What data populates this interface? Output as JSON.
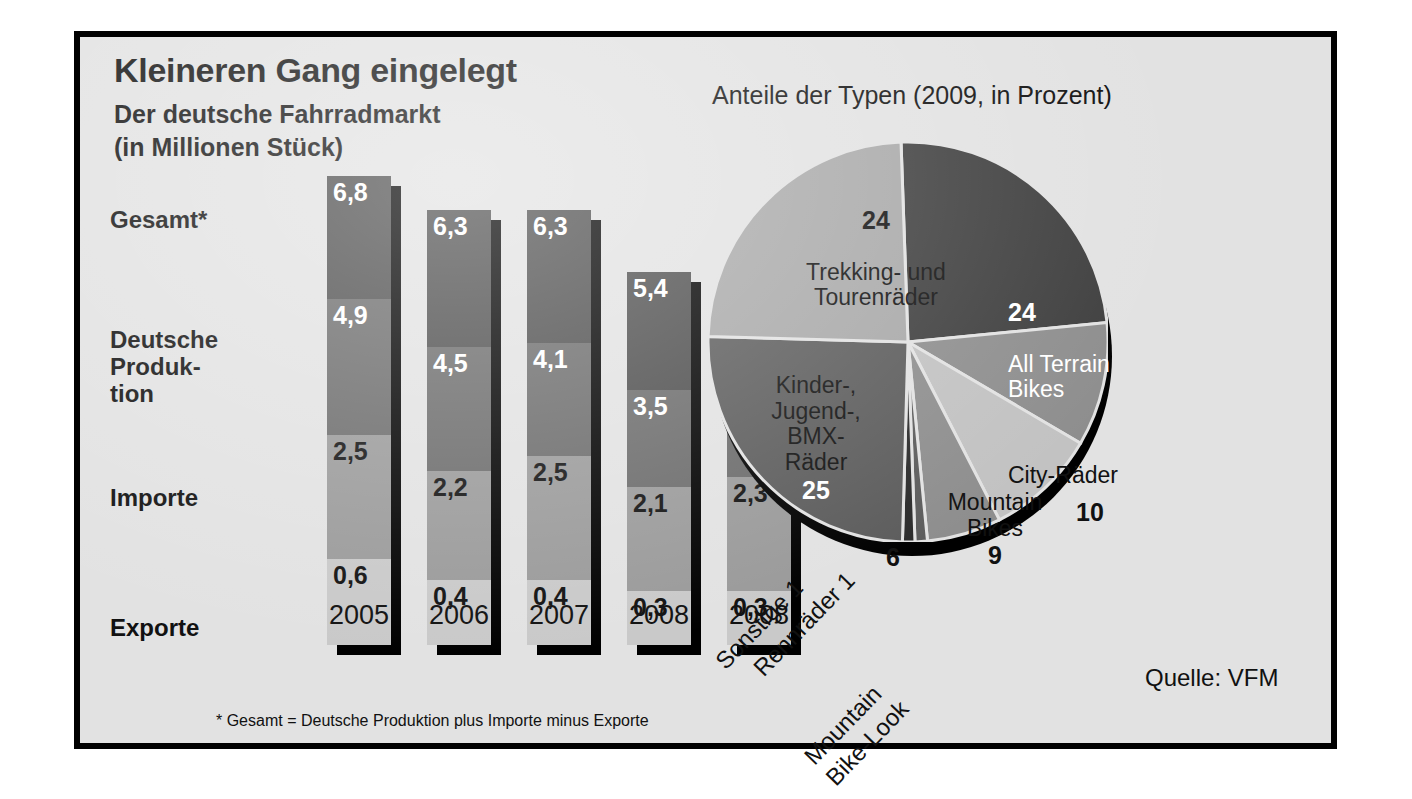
{
  "title": "Kleineren Gang eingelegt",
  "subtitle_line1": "Der deutsche Fahrradmarkt",
  "subtitle_line2": "(in Millionen Stück)",
  "pie_header": "Anteile der Typen (2009, in Prozent)",
  "source": "Quelle: VFM",
  "footnote": "* Gesamt = Deutsche Produktion plus Importe minus Exporte",
  "row_labels": {
    "total": "Gesamt*",
    "production": "Deutsche\nProduk-\ntion",
    "imports": "Importe",
    "exports": "Exporte"
  },
  "colors": {
    "background": "#e2e2e2",
    "frame": "#000000",
    "seg_total": "#4d4d4d",
    "seg_production": "#6b6b6b",
    "seg_imports": "#9a9a9a",
    "seg_exports": "#c9c9c9",
    "shadow": "#000000",
    "center_fill": "#ffffff"
  },
  "pie_center_text": "Gesamt:\n5,2 Millionen\nStück",
  "chart_data": [
    {
      "type": "bar",
      "title": "Der deutsche Fahrradmarkt (in Millionen Stück)",
      "xlabel": "",
      "ylabel": "Millionen Stück",
      "categories": [
        "2005",
        "2006",
        "2007",
        "2008",
        "2008"
      ],
      "series": [
        {
          "name": "Gesamt*",
          "values": [
            6.8,
            6.3,
            6.3,
            5.4,
            5.2
          ],
          "labels": [
            "6,8",
            "6,3",
            "6,3",
            "5,4",
            "5,2"
          ]
        },
        {
          "name": "Deutsche Produktion",
          "values": [
            4.9,
            4.5,
            4.1,
            3.5,
            3.2
          ],
          "labels": [
            "4,9",
            "4,5",
            "4,1",
            "3,5",
            "3,2"
          ]
        },
        {
          "name": "Importe",
          "values": [
            2.5,
            2.2,
            2.5,
            2.1,
            2.3
          ],
          "labels": [
            "2,5",
            "2,2",
            "2,5",
            "2,1",
            "2,3"
          ]
        },
        {
          "name": "Exporte",
          "values": [
            0.6,
            0.4,
            0.4,
            0.3,
            0.3
          ],
          "labels": [
            "0,6",
            "0,4",
            "0,4",
            "0,3",
            "0,3"
          ]
        }
      ],
      "note": "* Gesamt = Deutsche Produktion plus Importe minus Exporte"
    },
    {
      "type": "pie",
      "title": "Anteile der Typen (2009, in Prozent)",
      "center_label": "Gesamt: 5,2 Millionen Stück",
      "unit": "Prozent",
      "slices": [
        {
          "label": "All Terrain Bikes",
          "value": 24,
          "value_text": "24",
          "color": "#3f3f3f",
          "text_color": "#111111"
        },
        {
          "label": "City-Räder",
          "value": 10,
          "value_text": "10",
          "color": "#8e8e8e",
          "text_color": "#111111"
        },
        {
          "label": "Mountain Bikes",
          "value": 9,
          "value_text": "9",
          "color": "#c2c2c2",
          "text_color": "#111111"
        },
        {
          "label": "Mountain Bike-Look",
          "value": 6,
          "value_text": "6",
          "color": "#8e8e8e",
          "text_color": "#111111"
        },
        {
          "label": "Rennräder",
          "value": 1,
          "value_text": "1",
          "color": "#5c5c5c",
          "text_color": "#111111"
        },
        {
          "label": "Sonstige",
          "value": 1,
          "value_text": "1",
          "color": "#2b2b2b",
          "text_color": "#111111"
        },
        {
          "label": "Kinder-, Jugend-, BMX-Räder",
          "value": 25,
          "value_text": "25",
          "color": "#5c5c5c",
          "text_color": "#ffffff"
        },
        {
          "label": "Trekking- und Tourenräder",
          "value": 24,
          "value_text": "24",
          "color": "#a8a8a8",
          "text_color": "#111111"
        }
      ],
      "total": 100
    }
  ],
  "pie_labels": {
    "trekking_num": "24",
    "trekking_name": "Trekking- und\nTourenräder",
    "atb_num": "24",
    "atb_name": "All Terrain\nBikes",
    "city_name": "City-Räder",
    "city_num": "10",
    "mtb_name": "Mountain\nBikes",
    "mtb_num": "9",
    "mtblook_num": "6",
    "kinder_name": "Kinder-,\nJugend-,\nBMX-\nRäder",
    "kinder_num": "25",
    "sonstige": "Sonstige 1",
    "rennraeder": "Rennräder 1",
    "mtblook_name": "Mountain\nBike-Look"
  },
  "diagonal_labels": [
    {
      "text_name": "Sonstige",
      "text_num": "1"
    },
    {
      "text_name": "Rennräder",
      "text_num": "1"
    },
    {
      "text_name": "Mountain",
      "text_num": ""
    },
    {
      "text_name": "Bike-Look",
      "text_num": ""
    }
  ]
}
